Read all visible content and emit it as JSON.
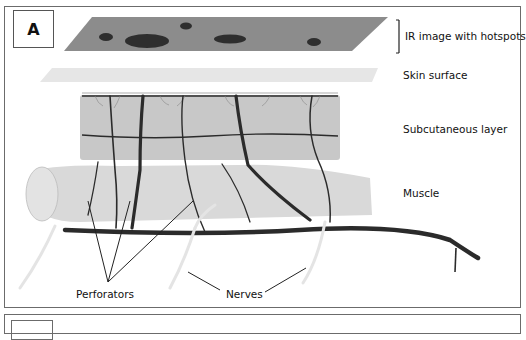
{
  "figure": {
    "panel_label": "A",
    "layers": [
      {
        "id": "ir",
        "label": "IR image with hotspots"
      },
      {
        "id": "skin",
        "label": "Skin surface"
      },
      {
        "id": "subcutaneous",
        "label": "Subcutaneous layer"
      },
      {
        "id": "muscle",
        "label": "Muscle"
      }
    ],
    "callouts": {
      "perforators": "Perforators",
      "nerves": "Nerves"
    },
    "colors": {
      "ir_plate": "#8c8c8c",
      "hotspot": "#2e2e2e",
      "skin": "#e6e6e6",
      "subcutaneous": "#c8c8c8",
      "muscle": "#d9d9d9",
      "vessel": "#2b2b2b",
      "nerve": "#e8e8e8"
    }
  }
}
